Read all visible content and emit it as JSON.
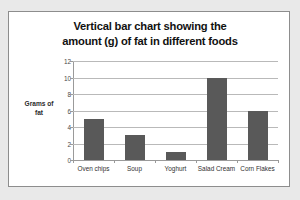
{
  "chart_data": {
    "type": "bar",
    "title": "Vertical bar chart showing the amount (g) of fat in different foods",
    "title_lines": [
      "Vertical bar chart showing the",
      "amount (g) of fat in different foods"
    ],
    "categories": [
      "Oven chips",
      "Soup",
      "Yoghurt",
      "Salad Cream",
      "Corn Flakes"
    ],
    "values": [
      5,
      3,
      1,
      10,
      6
    ],
    "xlabel": "",
    "ylabel": "Grams of fat",
    "ylabel_lines": [
      "Grams of",
      "fat"
    ],
    "ylim": [
      0,
      12
    ],
    "ytick_labels": [
      "0",
      "2",
      "4",
      "6",
      "8",
      "10",
      "12"
    ],
    "ytick_values": [
      0,
      2,
      4,
      6,
      8,
      10,
      12
    ],
    "grid": true,
    "legend": false,
    "bar_color": "#595959",
    "grid_color": "#b9b9b9",
    "axis_color": "#9a9a9a",
    "plot_background": "#ffffff",
    "page_background": "#e9e9e9"
  }
}
